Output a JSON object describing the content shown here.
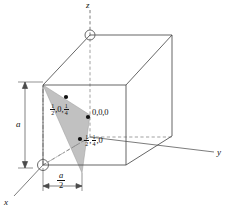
{
  "figure": {
    "background_color": "#ffffff",
    "line_color": "#4a4a4a",
    "dash_color": "#6e6e6e",
    "plane_fill": "#b9b9b9",
    "plane_edge": "#8e8e8e",
    "text_color": "#111111"
  },
  "axes": [
    {
      "name": "z-axis",
      "label": "z",
      "direction": "up"
    },
    {
      "name": "y-axis",
      "label": "y",
      "direction": "right"
    },
    {
      "name": "x-axis",
      "label": "x",
      "direction": "lower-left"
    }
  ],
  "points": [
    {
      "name": "point-half-0-quarter",
      "parts": [
        "1",
        "2",
        ",0,",
        "1",
        "4"
      ],
      "text": "1/2,0,1/4",
      "num1": "1",
      "den1": "2",
      "mid": ",0,",
      "num2": "1",
      "den2": "4"
    },
    {
      "name": "point-origin",
      "text": "0,0,0"
    },
    {
      "name": "point-half-quarter-0",
      "text": "1/2,1/4,0",
      "num1": "1",
      "den1": "2",
      "sep1": ",",
      "num2": "1",
      "den2": "4",
      "tail": ",0"
    }
  ],
  "dimensions": [
    {
      "name": "vertical-dimension",
      "label": "a",
      "orientation": "vertical"
    },
    {
      "name": "horizontal-dimension",
      "numerator": "a",
      "denominator": "2",
      "label": "a/2",
      "orientation": "horizontal"
    }
  ],
  "markers": [
    {
      "name": "circle-marker-top",
      "shape": "circle"
    },
    {
      "name": "circle-marker-origin",
      "shape": "circle"
    }
  ]
}
